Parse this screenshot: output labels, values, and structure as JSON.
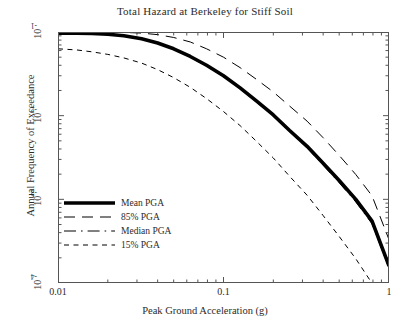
{
  "chart_data": {
    "type": "line",
    "title": "Total Hazard at Berkeley for Stiff Soil",
    "xlabel": "Peak Ground Acceleration (g)",
    "ylabel": "Annual Frequency of Exceedance",
    "xscale": "log",
    "yscale": "log",
    "xlim": [
      0.01,
      1
    ],
    "ylim": [
      0.0001,
      0.1
    ],
    "grid": false,
    "legend_position": "lower left inside axes",
    "xticks": [
      "0.01",
      "0.1",
      "1"
    ],
    "xtick_values": [
      0.01,
      0.1,
      1
    ],
    "yticks": [
      "10-1",
      "10-2",
      "10-3",
      "10-4"
    ],
    "ytick_values": [
      0.1,
      0.01,
      0.001,
      0.0001
    ],
    "ytick_mantissa": [
      "10",
      "10",
      "10",
      "10"
    ],
    "ytick_exponent": [
      "-1",
      "-2",
      "-3",
      "-4"
    ],
    "series": [
      {
        "name": "Mean PGA",
        "style": "thick-solid",
        "x": [
          0.01,
          0.013,
          0.016,
          0.02,
          0.025,
          0.032,
          0.04,
          0.05,
          0.063,
          0.079,
          0.1,
          0.126,
          0.158,
          0.2,
          0.25,
          0.32,
          0.4,
          0.5,
          0.63,
          0.79,
          1.0
        ],
        "y": [
          0.097,
          0.097,
          0.096,
          0.094,
          0.09,
          0.083,
          0.074,
          0.063,
          0.051,
          0.04,
          0.03,
          0.0215,
          0.015,
          0.0102,
          0.0067,
          0.0043,
          0.0027,
          0.00168,
          0.001,
          0.00055,
          0.00016
        ]
      },
      {
        "name": "85% PGA",
        "style": "long-dash",
        "x": [
          0.01,
          0.013,
          0.016,
          0.02,
          0.025,
          0.032,
          0.04,
          0.05,
          0.063,
          0.079,
          0.1,
          0.126,
          0.158,
          0.2,
          0.25,
          0.32,
          0.4,
          0.5,
          0.63,
          0.79,
          1.0
        ],
        "y": [
          0.1,
          0.1,
          0.1,
          0.1,
          0.099,
          0.097,
          0.093,
          0.086,
          0.076,
          0.063,
          0.05,
          0.0375,
          0.0272,
          0.0192,
          0.0131,
          0.0086,
          0.00545,
          0.00335,
          0.00198,
          0.0011,
          0.00033
        ]
      },
      {
        "name": "Median PGA",
        "style": "dash-dot",
        "x": [
          0.01,
          0.013,
          0.016,
          0.02,
          0.025,
          0.032,
          0.04,
          0.05,
          0.063,
          0.079,
          0.1,
          0.126,
          0.158,
          0.2,
          0.25,
          0.32,
          0.4,
          0.5,
          0.63,
          0.79,
          1.0
        ],
        "y": [
          0.096,
          0.096,
          0.095,
          0.093,
          0.089,
          0.082,
          0.073,
          0.062,
          0.05,
          0.039,
          0.0292,
          0.0209,
          0.0145,
          0.00985,
          0.00645,
          0.00412,
          0.00256,
          0.00158,
          0.00093,
          0.00051,
          0.00015
        ]
      },
      {
        "name": "15% PGA",
        "style": "short-dash",
        "x": [
          0.01,
          0.013,
          0.016,
          0.02,
          0.025,
          0.032,
          0.04,
          0.05,
          0.063,
          0.079,
          0.1,
          0.126,
          0.158,
          0.2,
          0.25,
          0.32,
          0.4,
          0.5,
          0.63,
          0.79,
          1.0
        ],
        "y": [
          0.063,
          0.061,
          0.058,
          0.054,
          0.049,
          0.0425,
          0.0355,
          0.0285,
          0.0218,
          0.016,
          0.0112,
          0.0076,
          0.00495,
          0.00312,
          0.0019,
          0.00112,
          0.00064,
          0.00036,
          0.000195,
          9.9e-05,
          2.7e-05
        ]
      }
    ],
    "legend": [
      {
        "label": "Mean PGA",
        "style": "thick-solid"
      },
      {
        "label": "85% PGA",
        "style": "long-dash"
      },
      {
        "label": "Median PGA",
        "style": "dash-dot"
      },
      {
        "label": "15% PGA",
        "style": "short-dash"
      }
    ],
    "colors": {
      "line": "#000000",
      "axis": "#555555",
      "text": "#2b2b2b",
      "background": "#ffffff"
    }
  }
}
